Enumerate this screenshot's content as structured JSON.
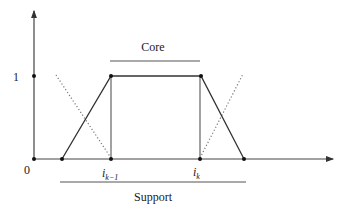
{
  "diagram": {
    "type": "trapezoidal-membership-function",
    "y_axis": {
      "tick_labels": [
        "1"
      ]
    },
    "x_axis": {
      "origin_label": "0"
    },
    "points": {
      "i_prev": {
        "base": "i",
        "sub": "k−1"
      },
      "i_k": {
        "base": "i",
        "sub": "k"
      }
    },
    "annotations": {
      "core_label": "Core",
      "support_label": "Support"
    },
    "colors": {
      "line": "#333333",
      "dotted": "#777777",
      "background": "#ffffff"
    }
  }
}
